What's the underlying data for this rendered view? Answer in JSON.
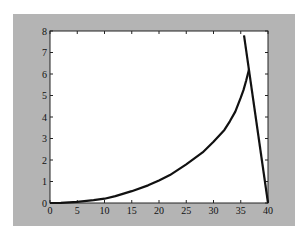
{
  "chart_data": {
    "type": "line",
    "title": "",
    "xlabel": "",
    "ylabel": "",
    "xlim": [
      0,
      40
    ],
    "ylim": [
      0,
      8
    ],
    "grid": false,
    "legend": null,
    "xticks": [
      "0",
      "5",
      "10",
      "15",
      "20",
      "25",
      "30",
      "35",
      "40"
    ],
    "yticks": [
      "0",
      "1",
      "2",
      "3",
      "4",
      "5",
      "6",
      "7",
      "8"
    ],
    "series": [
      {
        "name": "curve",
        "x": [
          0,
          2,
          5,
          8,
          10,
          12,
          15,
          18,
          20,
          22,
          25,
          28,
          30,
          32,
          33,
          34,
          35,
          35.5,
          36,
          36.5
        ],
        "y": [
          0,
          0.01,
          0.05,
          0.13,
          0.2,
          0.32,
          0.55,
          0.82,
          1.05,
          1.3,
          1.8,
          2.35,
          2.85,
          3.4,
          3.8,
          4.25,
          4.9,
          5.25,
          5.7,
          6.2
        ]
      },
      {
        "name": "line",
        "x": [
          35.6,
          40
        ],
        "y": [
          7.8,
          0
        ]
      }
    ],
    "colors": {
      "background": "#b4b4b4",
      "axes": "#ffffff",
      "line": "#111111"
    }
  }
}
